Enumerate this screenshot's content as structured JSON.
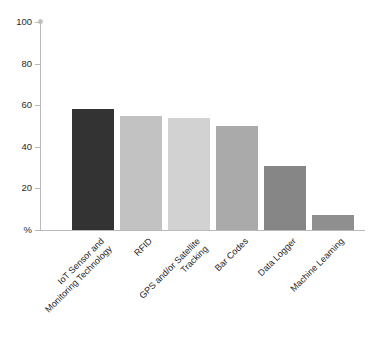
{
  "chart_data": {
    "type": "bar",
    "title": "",
    "xlabel": "",
    "ylabel": "%",
    "ylim": [
      0,
      100
    ],
    "yticks": [
      0,
      20,
      40,
      60,
      80,
      100
    ],
    "ytick_labels": [
      "%",
      "20",
      "40",
      "60",
      "80",
      "100"
    ],
    "grid": false,
    "legend": "none",
    "categories": [
      "IoT Sensor and\nMonitoring Technology",
      "RFID",
      "GPS and/or Satellite\nTracking",
      "Bar Codes",
      "Data Logger",
      "Machine Learning"
    ],
    "values": [
      58,
      55,
      54,
      50,
      31,
      7
    ],
    "bar_colors": [
      "#333333",
      "#c2c2c2",
      "#d2d2d2",
      "#aaaaaa",
      "#868686",
      "#8f8f8f"
    ],
    "axis_color": "#b9b9b9",
    "text_color": "#1c1c1c"
  }
}
